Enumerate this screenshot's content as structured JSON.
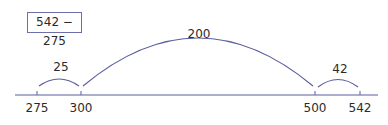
{
  "problem": "542 − 275",
  "number_line": {
    "ticks": [
      {
        "label": "275",
        "x": 37
      },
      {
        "label": "300",
        "x": 81
      },
      {
        "label": "500",
        "x": 315
      },
      {
        "label": "542",
        "x": 360
      }
    ]
  },
  "jumps": [
    {
      "label": "25",
      "from": "275",
      "to": "300"
    },
    {
      "label": "200",
      "from": "300",
      "to": "500"
    },
    {
      "label": "42",
      "from": "500",
      "to": "542"
    }
  ],
  "colors": {
    "line": "#5a5fa0",
    "text": "#2b2b2b"
  }
}
